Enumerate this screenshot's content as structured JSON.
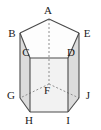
{
  "figure": {
    "kind": "pentagonal-prism-diagram",
    "width": 101,
    "height": 130,
    "background_color": "#ffffff",
    "stroke_color": "#4a4a4a",
    "hidden_stroke_color": "#8c8c8c",
    "top_face_color": "#ffffff",
    "front_face_color": "#f0f0f0",
    "side_face_color": "#dadada",
    "label_color": "#1a1a1a",
    "labels": [
      {
        "id": "A",
        "text": "A",
        "x": 48,
        "y": 10,
        "role": "top-back-vertex"
      },
      {
        "id": "B",
        "text": "B",
        "x": 12,
        "y": 33,
        "role": "top-left-vertex"
      },
      {
        "id": "C",
        "text": "C",
        "x": 26,
        "y": 52,
        "role": "top-front-left-vertex"
      },
      {
        "id": "D",
        "text": "D",
        "x": 71,
        "y": 52,
        "role": "top-front-right-vertex"
      },
      {
        "id": "E",
        "text": "E",
        "x": 87,
        "y": 33,
        "role": "top-right-vertex"
      },
      {
        "id": "F",
        "text": "F",
        "x": 47,
        "y": 90,
        "role": "bottom-back-vertex"
      },
      {
        "id": "G",
        "text": "G",
        "x": 11,
        "y": 95,
        "role": "bottom-left-vertex"
      },
      {
        "id": "H",
        "text": "H",
        "x": 29,
        "y": 120,
        "role": "bottom-front-left-vertex"
      },
      {
        "id": "I",
        "text": "I",
        "x": 68,
        "y": 120,
        "role": "bottom-front-right-vertex"
      },
      {
        "id": "J",
        "text": "J",
        "x": 88,
        "y": 95,
        "role": "bottom-right-vertex"
      }
    ],
    "vertices": {
      "A": [
        49,
        19
      ],
      "B": [
        20,
        33
      ],
      "C": [
        30,
        58
      ],
      "D": [
        68,
        58
      ],
      "E": [
        79,
        33
      ],
      "F": [
        49,
        84
      ],
      "G": [
        20,
        98
      ],
      "H": [
        30,
        112
      ],
      "I": [
        68,
        112
      ],
      "J": [
        79,
        98
      ]
    },
    "visible_edges": [
      "A-B",
      "A-E",
      "B-C",
      "C-D",
      "D-E",
      "B-G",
      "C-H",
      "D-I",
      "E-J",
      "G-H",
      "H-I",
      "I-J"
    ],
    "hidden_edges": [
      "A-F",
      "F-G",
      "F-J"
    ]
  }
}
